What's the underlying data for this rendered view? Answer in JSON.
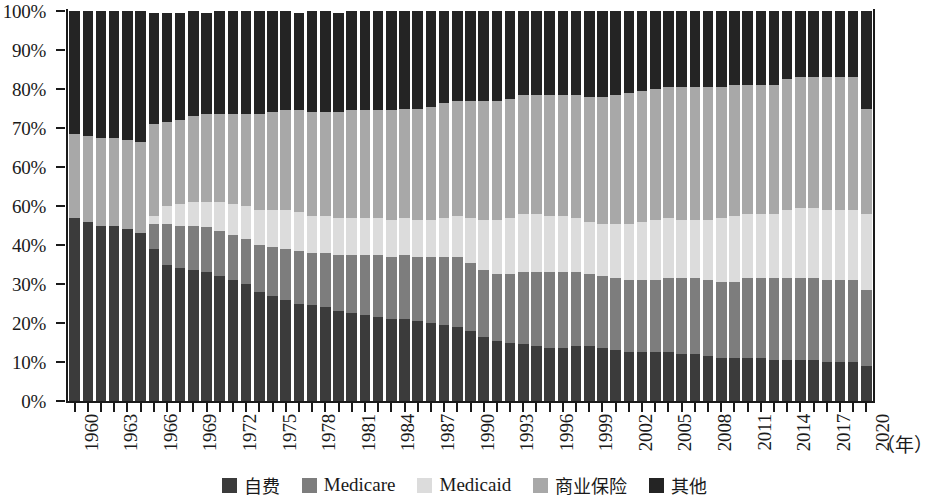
{
  "chart_data": {
    "type": "bar",
    "subtype": "stacked-percentage",
    "title": "",
    "xlabel": "(年)",
    "ylabel": "",
    "ylim": [
      0,
      100
    ],
    "grid": false,
    "legend_position": "bottom",
    "y_tick_labels": [
      "0%",
      "10%",
      "20%",
      "30%",
      "40%",
      "60%",
      "60%",
      "70%",
      "80%",
      "90%",
      "100%"
    ],
    "y_tick_values": [
      0,
      10,
      20,
      30,
      40,
      50,
      60,
      70,
      80,
      90,
      100
    ],
    "x_tick_labels": [
      "1960",
      "1963",
      "1966",
      "1969",
      "1972",
      "1975",
      "1978",
      "1981",
      "1984",
      "1987",
      "1990",
      "1993",
      "1996",
      "1999",
      "2002",
      "2005",
      "2008",
      "2011",
      "2014",
      "2017",
      "2020"
    ],
    "categories": [
      "1960",
      "1961",
      "1962",
      "1963",
      "1964",
      "1965",
      "1966",
      "1967",
      "1968",
      "1969",
      "1970",
      "1971",
      "1972",
      "1973",
      "1974",
      "1975",
      "1976",
      "1977",
      "1978",
      "1979",
      "1980",
      "1981",
      "1982",
      "1983",
      "1984",
      "1985",
      "1986",
      "1987",
      "1988",
      "1989",
      "1990",
      "1991",
      "1992",
      "1993",
      "1994",
      "1995",
      "1996",
      "1997",
      "1998",
      "1999",
      "2000",
      "2001",
      "2002",
      "2003",
      "2004",
      "2005",
      "2006",
      "2007",
      "2008",
      "2009",
      "2010",
      "2011",
      "2012",
      "2013",
      "2014",
      "2015",
      "2016",
      "2017",
      "2018",
      "2019",
      "2020"
    ],
    "series": [
      {
        "name": "自费",
        "color": "#3b3b3b",
        "values": [
          47.0,
          46.0,
          45.0,
          45.0,
          44.0,
          43.0,
          39.0,
          35.0,
          34.0,
          33.5,
          33.0,
          32.0,
          31.0,
          30.0,
          28.0,
          27.0,
          26.0,
          25.0,
          24.5,
          24.0,
          23.0,
          22.5,
          22.0,
          21.5,
          21.0,
          21.0,
          20.5,
          20.0,
          19.5,
          19.0,
          18.0,
          16.5,
          15.5,
          15.0,
          14.5,
          14.0,
          13.5,
          13.5,
          14.0,
          14.0,
          13.5,
          13.0,
          12.5,
          12.5,
          12.5,
          12.5,
          12.0,
          12.0,
          11.5,
          11.0,
          11.0,
          11.0,
          11.0,
          10.5,
          10.5,
          10.5,
          10.5,
          10.0,
          10.0,
          10.0,
          9.0
        ]
      },
      {
        "name": "Medicare",
        "color": "#7d7d7d",
        "values": [
          0.0,
          0.0,
          0.0,
          0.0,
          0.0,
          0.0,
          6.5,
          10.5,
          11.0,
          11.5,
          11.5,
          11.5,
          11.5,
          11.5,
          12.0,
          12.5,
          13.0,
          13.5,
          13.5,
          14.0,
          14.5,
          15.0,
          15.5,
          16.0,
          16.0,
          16.5,
          16.5,
          17.0,
          17.5,
          18.0,
          17.5,
          17.0,
          17.0,
          17.5,
          18.5,
          19.0,
          19.5,
          19.5,
          19.0,
          18.5,
          18.5,
          18.5,
          18.5,
          18.5,
          18.5,
          19.0,
          19.5,
          19.5,
          19.5,
          19.5,
          19.5,
          20.5,
          20.5,
          21.0,
          21.0,
          21.0,
          21.0,
          21.0,
          21.0,
          21.0,
          19.5
        ]
      },
      {
        "name": "Medicaid",
        "color": "#dcdcdc",
        "values": [
          0.0,
          0.0,
          0.0,
          0.0,
          0.0,
          0.0,
          2.0,
          4.5,
          5.5,
          6.0,
          6.5,
          7.5,
          8.0,
          8.5,
          9.0,
          9.5,
          10.0,
          10.0,
          9.5,
          9.5,
          9.5,
          9.5,
          9.5,
          9.5,
          9.5,
          9.5,
          9.5,
          9.5,
          10.0,
          10.5,
          11.5,
          13.0,
          14.0,
          14.5,
          15.0,
          15.0,
          14.5,
          14.5,
          14.0,
          13.5,
          13.5,
          14.0,
          14.5,
          15.0,
          15.5,
          15.5,
          15.0,
          15.0,
          15.5,
          16.5,
          17.0,
          16.5,
          16.5,
          16.5,
          17.5,
          18.0,
          18.0,
          18.0,
          18.0,
          18.0,
          19.5
        ]
      },
      {
        "name": "商业保险",
        "color": "#a8a8a8",
        "values": [
          21.5,
          22.0,
          22.5,
          22.5,
          23.0,
          23.5,
          23.5,
          21.5,
          21.5,
          22.0,
          22.5,
          22.5,
          23.0,
          23.5,
          24.5,
          25.0,
          25.5,
          26.0,
          26.5,
          26.5,
          27.0,
          27.5,
          27.5,
          27.5,
          28.0,
          28.0,
          28.5,
          29.0,
          29.5,
          29.5,
          30.0,
          30.5,
          30.5,
          30.5,
          30.5,
          30.5,
          31.0,
          31.0,
          31.5,
          32.0,
          32.5,
          33.0,
          33.5,
          33.5,
          33.5,
          33.5,
          34.0,
          34.0,
          34.0,
          33.5,
          33.5,
          33.0,
          33.0,
          33.0,
          33.5,
          33.5,
          33.5,
          34.0,
          34.0,
          34.0,
          27.0
        ]
      },
      {
        "name": "其他",
        "color": "#242424",
        "values": [
          31.5,
          32.0,
          32.5,
          32.5,
          33.0,
          33.5,
          28.5,
          28.0,
          27.5,
          27.0,
          26.0,
          26.5,
          26.5,
          26.5,
          26.5,
          26.0,
          25.5,
          25.0,
          26.0,
          26.0,
          25.5,
          25.5,
          25.5,
          25.5,
          25.5,
          25.0,
          25.0,
          24.5,
          23.5,
          23.0,
          23.0,
          23.0,
          23.0,
          22.5,
          21.5,
          21.5,
          21.5,
          21.5,
          21.5,
          22.0,
          22.0,
          21.5,
          21.0,
          20.5,
          20.0,
          19.5,
          19.5,
          19.5,
          19.5,
          19.5,
          19.0,
          19.0,
          19.0,
          19.0,
          17.5,
          17.0,
          17.0,
          17.0,
          17.0,
          17.0,
          25.0
        ]
      }
    ]
  },
  "legend": {
    "items": [
      {
        "label": "自费",
        "color": "#3b3b3b",
        "cjk": true
      },
      {
        "label": "Medicare",
        "color": "#7d7d7d",
        "cjk": false
      },
      {
        "label": "Medicaid",
        "color": "#dcdcdc",
        "cjk": false
      },
      {
        "label": "商业保险",
        "color": "#a8a8a8",
        "cjk": true
      },
      {
        "label": "其他",
        "color": "#242424",
        "cjk": true
      }
    ]
  },
  "axis": {
    "x_unit": "（年）"
  }
}
